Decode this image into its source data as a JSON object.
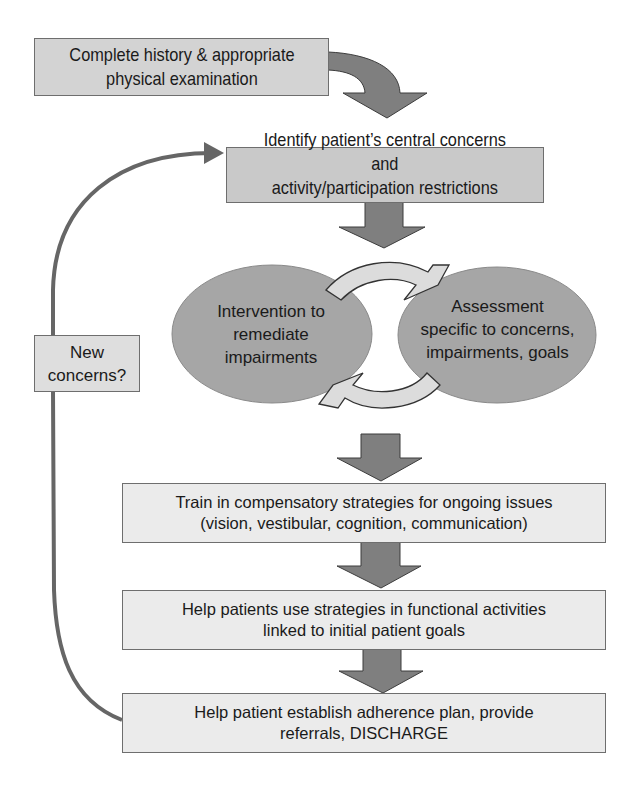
{
  "diagram": {
    "colors": {
      "arrow_fill": "#7f7f7f",
      "arrow_stroke": "#3c3c3c",
      "ellipse_fill": "#a6a6a6",
      "ellipse_stroke": "#8a8a8a",
      "cycle_arrow_fill": "#dcdcdc",
      "feedback_line": "#666666",
      "box_top_fill": "#d3d3d3",
      "box_mid_fill": "#c9c9c9",
      "box_low_fill": "#ebebeb"
    },
    "nodes": {
      "history_exam": {
        "lines": [
          "Complete history & appropriate",
          "physical examination"
        ]
      },
      "identify_concerns": {
        "lines": [
          "Identify patient’s central concerns",
          "and",
          "activity/participation restrictions"
        ]
      },
      "intervention": {
        "lines": [
          "Intervention to",
          "remediate",
          "impairments"
        ]
      },
      "assessment": {
        "lines": [
          "Assessment",
          "specific to concerns,",
          "impairments, goals"
        ]
      },
      "new_concerns": {
        "lines": [
          "New",
          "concerns?"
        ]
      },
      "train_compensatory": {
        "lines": [
          "Train in compensatory strategies for ongoing issues",
          "(vision, vestibular, cognition, communication)"
        ]
      },
      "functional_activities": {
        "lines": [
          "Help patients use strategies in functional activities",
          "linked to initial patient goals"
        ]
      },
      "discharge": {
        "lines": [
          "Help patient establish adherence plan, provide",
          "referrals, DISCHARGE"
        ]
      }
    },
    "edges": [
      {
        "from": "history_exam",
        "to": "identify_concerns",
        "style": "curved-block-arrow"
      },
      {
        "from": "identify_concerns",
        "to": "intervention_assessment_cycle",
        "style": "block-arrow"
      },
      {
        "from": "intervention",
        "to": "assessment",
        "style": "cycle-arrow"
      },
      {
        "from": "assessment",
        "to": "intervention",
        "style": "cycle-arrow"
      },
      {
        "from": "intervention_assessment_cycle",
        "to": "train_compensatory",
        "style": "block-arrow"
      },
      {
        "from": "train_compensatory",
        "to": "functional_activities",
        "style": "block-arrow"
      },
      {
        "from": "functional_activities",
        "to": "discharge",
        "style": "block-arrow"
      },
      {
        "from": "discharge",
        "to": "identify_concerns",
        "style": "feedback-line",
        "label": "New concerns?"
      }
    ]
  }
}
